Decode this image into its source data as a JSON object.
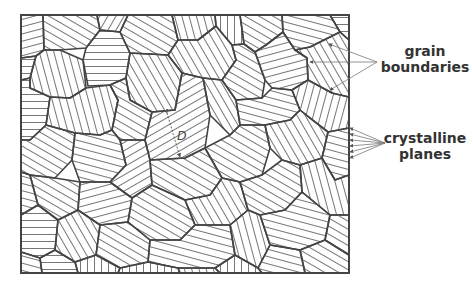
{
  "figure": {
    "labels": {
      "grain_boundaries": "grain\nboundaries",
      "grain_boundaries_line1": "grain",
      "grain_boundaries_line2": "boundaries",
      "crystalline_planes_line1": "crystalline",
      "crystalline_planes_line2": "planes",
      "diameter": "D"
    },
    "colors": {
      "boundary": "#444444",
      "hatch": "#666666",
      "text": "#333333",
      "background": "#ffffff"
    },
    "frame": {
      "x": 21,
      "y": 15,
      "width": 328,
      "height": 258
    }
  }
}
